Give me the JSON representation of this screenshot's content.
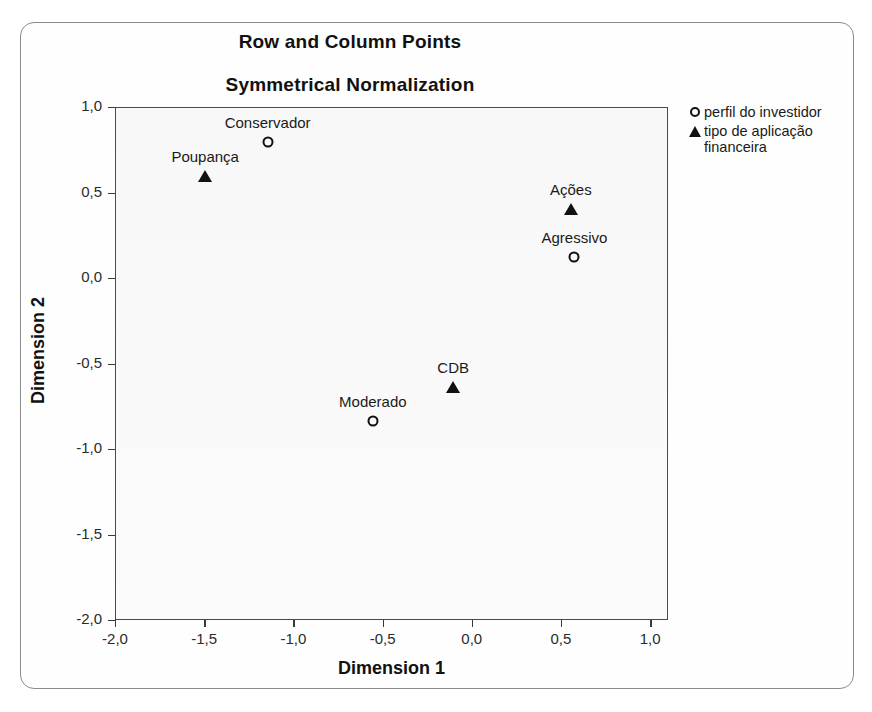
{
  "chart_data": {
    "type": "scatter",
    "title": "Row and Column Points",
    "subtitle": "Symmetrical Normalization",
    "xlabel": "Dimension 1",
    "ylabel": "Dimension 2",
    "xlim": [
      -2.0,
      1.1
    ],
    "ylim": [
      -2.0,
      1.0
    ],
    "grid": false,
    "legend_position": "right-top",
    "xticks": [
      -2.0,
      -1.5,
      -1.0,
      -0.5,
      0.0,
      0.5,
      1.0
    ],
    "xticklabels": [
      "-2,0",
      "-1,5",
      "-1,0",
      "-0,5",
      "0,0",
      "0,5",
      "1,0"
    ],
    "yticks": [
      1.0,
      0.5,
      0.0,
      -0.5,
      -1.0,
      -1.5,
      -2.0
    ],
    "yticklabels": [
      "1,0",
      "0,5",
      "0,0",
      "-0,5",
      "-1,0",
      "-1,5",
      "-2,0"
    ],
    "series": [
      {
        "name": "perfil do investidor",
        "marker": "open-circle",
        "points": [
          {
            "label": "Conservador",
            "x": -1.15,
            "y": 0.8
          },
          {
            "label": "Agressivo",
            "x": 0.57,
            "y": 0.13
          },
          {
            "label": "Moderado",
            "x": -0.56,
            "y": -0.83
          }
        ]
      },
      {
        "name": "tipo de aplicação financeira",
        "marker": "filled-triangle",
        "points": [
          {
            "label": "Poupança",
            "x": -1.5,
            "y": 0.6
          },
          {
            "label": "Ações",
            "x": 0.55,
            "y": 0.41
          },
          {
            "label": "CDB",
            "x": -0.11,
            "y": -0.63
          }
        ]
      }
    ]
  },
  "legend": {
    "items": [
      {
        "label": "perfil do investidor",
        "marker": "open-circle"
      },
      {
        "label": "tipo de aplicação financeira",
        "marker": "filled-triangle"
      }
    ]
  },
  "colors": {
    "marker": "#111111",
    "axis": "#3a3a3a",
    "frame": "#8b8b8b",
    "text": "#1a1a1a"
  }
}
